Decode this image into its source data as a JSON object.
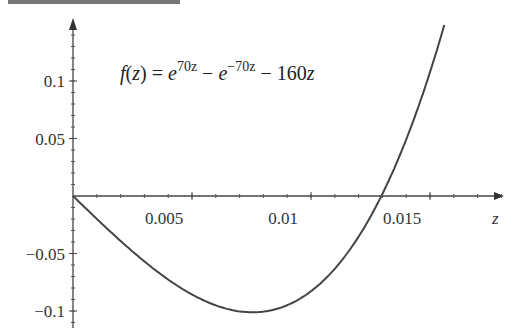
{
  "chart_data": {
    "type": "line",
    "title": "",
    "annotation": "f(z) = e^{70z} − e^{−70z} − 160z",
    "annotation_parts": {
      "lhs": "f(z) = e",
      "exp1": "70z",
      "mid": " − e",
      "exp2": "−70z",
      "tail": " − 160z"
    },
    "xlabel": "z",
    "ylabel": "",
    "xlim": [
      0,
      0.0183
    ],
    "ylim": [
      -0.105,
      0.153
    ],
    "x_ticks": [
      {
        "value": 0.005,
        "label": "0.005"
      },
      {
        "value": 0.01,
        "label": "0.01"
      },
      {
        "value": 0.015,
        "label": "0.015"
      }
    ],
    "y_ticks": [
      {
        "value": 0.1,
        "label": "0.1"
      },
      {
        "value": 0.05,
        "label": "0.05"
      },
      {
        "value": -0.05,
        "label": "−0.05"
      },
      {
        "value": -0.1,
        "label": "−0.1"
      }
    ],
    "grid": false,
    "legend": null,
    "function": "exp(70*z) - exp(-70*z) - 160*z",
    "x": [
      0,
      0.001,
      0.002,
      0.003,
      0.004,
      0.005,
      0.006,
      0.007,
      0.008,
      0.009,
      0.01,
      0.011,
      0.012,
      0.013,
      0.014,
      0.015,
      0.0156
    ],
    "values": [
      0,
      -0.02,
      -0.04,
      -0.058,
      -0.074,
      -0.087,
      -0.097,
      -0.102,
      -0.102,
      -0.096,
      -0.082,
      -0.06,
      -0.029,
      0.002,
      0.048,
      0.106,
      0.151
    ],
    "line_color": "#444444"
  }
}
